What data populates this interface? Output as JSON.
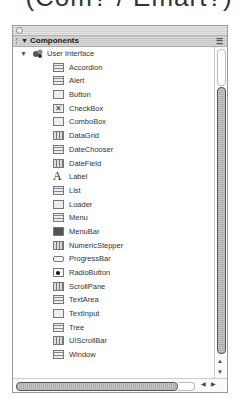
{
  "page_heading_cut": "(Com? / Emart?)",
  "panel": {
    "title": "Components",
    "folder": {
      "label": "User Interface",
      "expanded": true
    },
    "items": [
      {
        "label": "Accordion",
        "icon": "accordion-icon"
      },
      {
        "label": "Alert",
        "icon": "alert-icon"
      },
      {
        "label": "Button",
        "icon": "button-icon"
      },
      {
        "label": "CheckBox",
        "icon": "checkbox-icon"
      },
      {
        "label": "ComboBox",
        "icon": "combobox-icon"
      },
      {
        "label": "DataGrid",
        "icon": "datagrid-icon"
      },
      {
        "label": "DateChooser",
        "icon": "datechooser-icon"
      },
      {
        "label": "DateField",
        "icon": "datefield-icon"
      },
      {
        "label": "Label",
        "icon": "label-icon"
      },
      {
        "label": "List",
        "icon": "list-icon"
      },
      {
        "label": "Loader",
        "icon": "loader-icon"
      },
      {
        "label": "Menu",
        "icon": "menu-icon"
      },
      {
        "label": "MenuBar",
        "icon": "menubar-icon"
      },
      {
        "label": "NumericStepper",
        "icon": "numericstepper-icon"
      },
      {
        "label": "ProgressBar",
        "icon": "progressbar-icon"
      },
      {
        "label": "RadioButton",
        "icon": "radiobutton-icon"
      },
      {
        "label": "ScrollPane",
        "icon": "scrollpane-icon"
      },
      {
        "label": "TextArea",
        "icon": "textarea-icon"
      },
      {
        "label": "TextInput",
        "icon": "textinput-icon"
      },
      {
        "label": "Tree",
        "icon": "tree-icon"
      },
      {
        "label": "UIScrollBar",
        "icon": "uiscrollbar-icon"
      },
      {
        "label": "Window",
        "icon": "window-icon"
      }
    ]
  }
}
